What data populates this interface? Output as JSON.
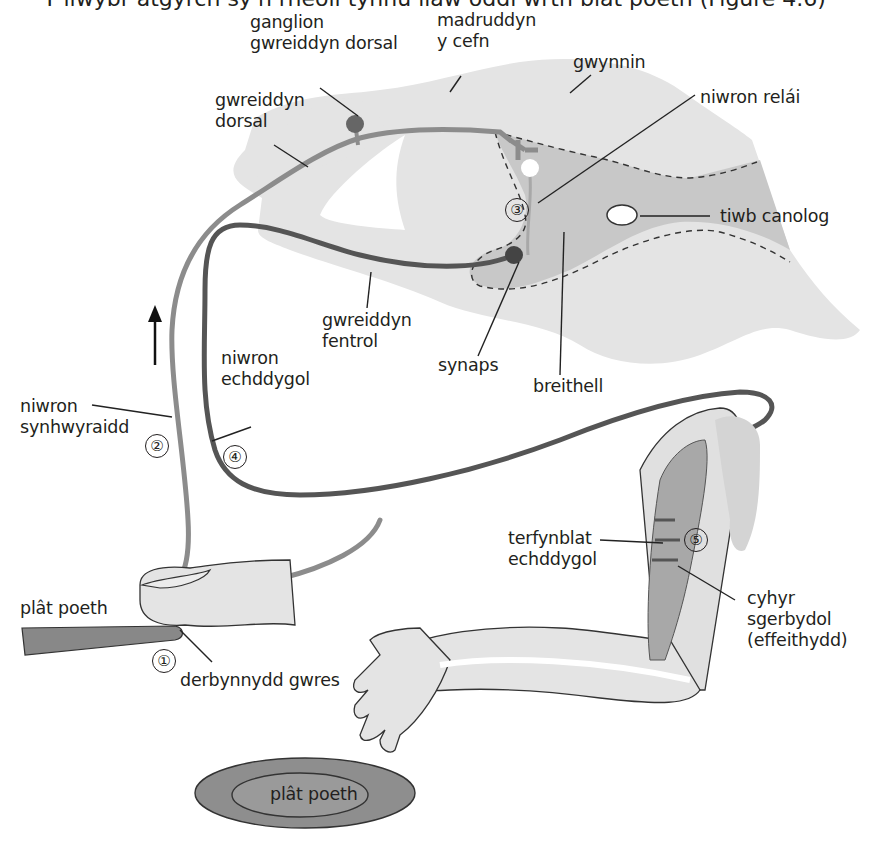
{
  "title": "Y llwybr atgyrch sy'n rheoli tynnu llaw oddi wrth blât poeth (Figure 4.6)",
  "labels": {
    "ganglion": [
      "ganglion",
      "gwreiddyn dorsal"
    ],
    "madruddyn": [
      "madruddyn",
      "y cefn"
    ],
    "gwynnin": "gwynnin",
    "gwreiddyn_dorsal": [
      "gwreiddyn",
      "dorsal"
    ],
    "niwron_relai": "niwron relái",
    "tiwb_canolog": "tiwb canolog",
    "gwreiddyn_fentrol": [
      "gwreiddyn",
      "fentrol"
    ],
    "synaps": "synaps",
    "breithell": "breithell",
    "niwron_echddygol": [
      "niwron",
      "echddygol"
    ],
    "niwron_synhwyraidd": [
      "niwron",
      "synhwyraidd"
    ],
    "terfynblat": [
      "terfynblat",
      "echddygol"
    ],
    "cyhyr": [
      "cyhyr",
      "sgerbydol",
      "(effeithydd)"
    ],
    "plat_poeth_side": "plât poeth",
    "derbynnydd": "derbynnydd gwres",
    "plat_poeth_plate": "plât poeth"
  },
  "steps": [
    "①",
    "②",
    "③",
    "④",
    "⑤"
  ],
  "colors": {
    "white_matter": "#e3e3e3",
    "grey_matter": "#c9c9c9",
    "skin": "#e6e6e6",
    "sensory_neuron": "#8c8c8c",
    "motor_neuron": "#555555",
    "muscle": "#9a9a9a",
    "hot_plate": "#8a8a8a",
    "outline": "#231f20"
  }
}
